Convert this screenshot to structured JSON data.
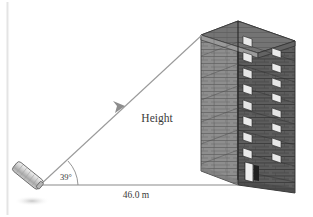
{
  "figure": {
    "kind": "angle-of-elevation-diagram",
    "background_color": "#ffffff",
    "line_color": "#7b7b7b",
    "text_color": "#3a3a3a"
  },
  "labels": {
    "height": "Height",
    "distance": "46.0 m",
    "angle": "39°"
  },
  "measurements": {
    "angle_value": "39",
    "angle_unit": "°",
    "distance_value": "46.0",
    "distance_unit": "m",
    "height_value": "Height"
  },
  "building": {
    "name": "apartment-tower",
    "face_front_color": "#575757",
    "face_side_color": "#8c8c8c",
    "roof_color": "#6e6e6e",
    "window_color": "#e8e8e8",
    "door_color": "#2b2b2b",
    "mortar_color": "#3d3d3d",
    "window_columns": 2,
    "window_rows": 10,
    "stories": 10
  },
  "instrument": {
    "name": "sighting-device",
    "body_color": "#cfcfcf",
    "outline_color": "#6a6a6a"
  },
  "lines": {
    "sight_line_name": "line-of-sight",
    "ground_line_name": "ground-baseline",
    "arc_name": "angle-arc",
    "arrow_name": "sight-arrowhead"
  },
  "artifacts": {
    "page_edge_color": "#e4e4e4"
  }
}
